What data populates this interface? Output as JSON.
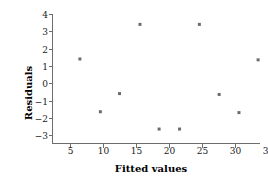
{
  "chart_data": {
    "type": "scatter",
    "title": "",
    "xlabel": "Fitted values",
    "ylabel": "Residuals",
    "xlim": [
      2.5,
      36
    ],
    "ylim": [
      -3.4,
      4.2
    ],
    "grid": false,
    "legend": null,
    "xticks": [
      5,
      10,
      15,
      20,
      25,
      30,
      35
    ],
    "xtick_labels": [
      "5",
      "10",
      "15",
      "20",
      "25",
      "30",
      "35"
    ],
    "yticks": [
      -3,
      -2,
      -1,
      0,
      1,
      2,
      3,
      4
    ],
    "ytick_labels": [
      "−3",
      "−2",
      "−1",
      "0",
      "1",
      "2",
      "3",
      "4"
    ],
    "marker": "square",
    "marker_color": "#6b6b6b",
    "marker_size": 3,
    "x": [
      6.5,
      9.6,
      12.5,
      15.6,
      18.5,
      21.6,
      24.6,
      27.6,
      30.6,
      33.5
    ],
    "y": [
      1.4,
      -1.65,
      -0.6,
      3.4,
      -2.65,
      -2.65,
      3.4,
      -0.65,
      -1.7,
      1.35
    ],
    "points": [
      {
        "x": 6.5,
        "y": 1.4
      },
      {
        "x": 9.6,
        "y": -1.65
      },
      {
        "x": 12.5,
        "y": -0.6
      },
      {
        "x": 15.6,
        "y": 3.4
      },
      {
        "x": 18.5,
        "y": -2.65
      },
      {
        "x": 21.6,
        "y": -2.65
      },
      {
        "x": 24.6,
        "y": 3.4
      },
      {
        "x": 27.6,
        "y": -0.65
      },
      {
        "x": 30.6,
        "y": -1.7
      },
      {
        "x": 33.5,
        "y": 1.35
      }
    ],
    "axis_color": "#6d6d6d",
    "text_color": "#1a1a1a"
  }
}
